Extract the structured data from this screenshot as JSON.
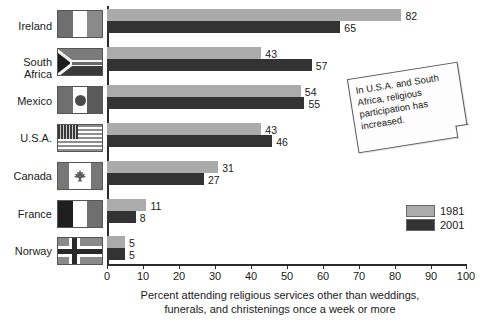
{
  "chart_data": {
    "type": "bar",
    "orientation": "horizontal",
    "title": "",
    "xlabel": "Percent attending religious services other than weddings, funerals, and christenings once a week or more",
    "ylabel": "",
    "xlim": [
      0,
      100
    ],
    "xticks": [
      0,
      10,
      20,
      30,
      40,
      50,
      60,
      70,
      80,
      90,
      100
    ],
    "grid": false,
    "legend_position": "right-lower",
    "categories": [
      "Ireland",
      "South Africa",
      "Mexico",
      "U.S.A.",
      "Canada",
      "France",
      "Norway"
    ],
    "series": [
      {
        "name": "1981",
        "color": "#ababab",
        "values": [
          82,
          43,
          54,
          43,
          31,
          11,
          5
        ]
      },
      {
        "name": "2001",
        "color": "#333333",
        "values": [
          65,
          57,
          55,
          46,
          27,
          8,
          5
        ]
      }
    ],
    "annotations": [
      {
        "text": "In U.S.A. and South Africa, religious participation has increased."
      }
    ]
  },
  "axis": {
    "title_line1": "Percent attending religious services other than weddings,",
    "title_line2": "funerals, and christenings once a week or more",
    "ticks": [
      "0",
      "10",
      "20",
      "30",
      "40",
      "50",
      "60",
      "70",
      "80",
      "90",
      "100"
    ]
  },
  "categories": [
    {
      "label": "Ireland",
      "flag": "flag-ireland"
    },
    {
      "label": "South\nAfrica",
      "flag": "flag-south-africa"
    },
    {
      "label": "Mexico",
      "flag": "flag-mexico"
    },
    {
      "label": "U.S.A.",
      "flag": "flag-usa"
    },
    {
      "label": "Canada",
      "flag": "flag-canada"
    },
    {
      "label": "France",
      "flag": "flag-france"
    },
    {
      "label": "Norway",
      "flag": "flag-norway"
    }
  ],
  "values_1981": [
    "82",
    "43",
    "54",
    "43",
    "31",
    "11",
    "5"
  ],
  "values_2001": [
    "65",
    "57",
    "55",
    "46",
    "27",
    "8",
    "5"
  ],
  "legend": {
    "items": [
      {
        "label": "1981",
        "color": "#ababab"
      },
      {
        "label": "2001",
        "color": "#333333"
      }
    ]
  },
  "callout": {
    "text": "In U.S.A. and South Africa, religious participation has increased."
  },
  "colors": {
    "bar_1981": "#ababab",
    "bar_2001": "#333333",
    "axis": "#2b2b2b",
    "text": "#1a1a1a",
    "background": "#ffffff"
  }
}
